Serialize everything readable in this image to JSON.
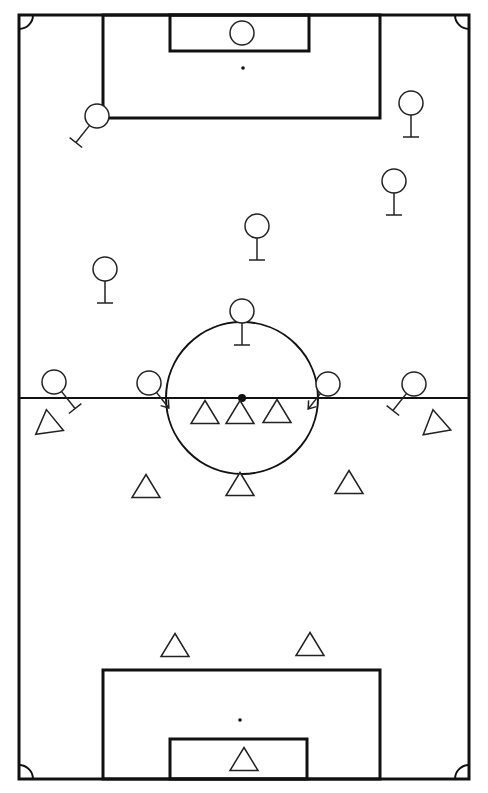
{
  "diagram": {
    "type": "soccer-tactics-board",
    "colors": {
      "background": "#ffffff",
      "lines": "#111111",
      "players": "#222222"
    },
    "field": {
      "outer": {
        "x": 19,
        "y": 15,
        "w": 450,
        "h": 764
      },
      "halfway_y": 398,
      "center_spot": {
        "x": 242,
        "y": 398
      },
      "center_circle_r": 76,
      "top_penalty_box": {
        "x": 103,
        "y": 15,
        "w": 277,
        "h": 103
      },
      "top_goal_box": {
        "x": 170,
        "y": 15,
        "w": 139,
        "h": 36
      },
      "top_penalty_spot": {
        "x": 243,
        "y": 68
      },
      "bottom_penalty_box": {
        "x": 103,
        "y": 670,
        "w": 277,
        "h": 109
      },
      "bottom_goal_box": {
        "x": 170,
        "y": 739,
        "w": 137,
        "h": 40
      },
      "bottom_penalty_spot": {
        "x": 240,
        "y": 720
      },
      "corner_arc_r": 14
    },
    "team_circles": {
      "symbol": "circle",
      "players": [
        {
          "id": "c-goalkeeper",
          "x": 242,
          "y": 33,
          "r": 12,
          "marker": "none"
        },
        {
          "id": "c-left-back",
          "x": 97,
          "y": 116,
          "r": 12,
          "marker": "block-line",
          "dir": "down-left"
        },
        {
          "id": "c-right-back",
          "x": 411,
          "y": 103,
          "r": 12,
          "marker": "block-line",
          "dir": "down"
        },
        {
          "id": "c-right-center-back",
          "x": 394,
          "y": 181,
          "r": 12,
          "marker": "block-line",
          "dir": "down"
        },
        {
          "id": "c-center-mid",
          "x": 257,
          "y": 226,
          "r": 12,
          "marker": "block-line",
          "dir": "down"
        },
        {
          "id": "c-left-mid",
          "x": 105,
          "y": 269,
          "r": 12,
          "marker": "block-line",
          "dir": "down"
        },
        {
          "id": "c-center-forward",
          "x": 242,
          "y": 311,
          "r": 12,
          "marker": "block-line",
          "dir": "down"
        },
        {
          "id": "c-left-wing",
          "x": 54,
          "y": 382,
          "r": 12,
          "marker": "block-line",
          "dir": "down-right"
        },
        {
          "id": "c-left-inside",
          "x": 149,
          "y": 383,
          "r": 12,
          "marker": "arrow",
          "dir": "down-right"
        },
        {
          "id": "c-right-inside",
          "x": 328,
          "y": 384,
          "r": 12,
          "marker": "arrow",
          "dir": "down-left"
        },
        {
          "id": "c-right-wing",
          "x": 414,
          "y": 384,
          "r": 12,
          "marker": "block-line",
          "dir": "down-left"
        }
      ]
    },
    "team_triangles": {
      "symbol": "triangle",
      "players": [
        {
          "id": "t-left-wing",
          "x": 48,
          "y": 421,
          "rotate": -8
        },
        {
          "id": "t-left-forward",
          "x": 205,
          "y": 412,
          "rotate": 0
        },
        {
          "id": "t-center-forward",
          "x": 240,
          "y": 412,
          "rotate": 0
        },
        {
          "id": "t-right-forward",
          "x": 277,
          "y": 411,
          "rotate": 0
        },
        {
          "id": "t-right-wing",
          "x": 435,
          "y": 421,
          "rotate": -10
        },
        {
          "id": "t-left-mid",
          "x": 146,
          "y": 486,
          "rotate": 0
        },
        {
          "id": "t-center-mid",
          "x": 240,
          "y": 484,
          "rotate": 0
        },
        {
          "id": "t-right-mid",
          "x": 349,
          "y": 482,
          "rotate": 0
        },
        {
          "id": "t-left-back",
          "x": 175,
          "y": 645,
          "rotate": 0
        },
        {
          "id": "t-right-back",
          "x": 310,
          "y": 644,
          "rotate": 0
        },
        {
          "id": "t-goalkeeper",
          "x": 244,
          "y": 759,
          "rotate": 0
        }
      ]
    }
  }
}
